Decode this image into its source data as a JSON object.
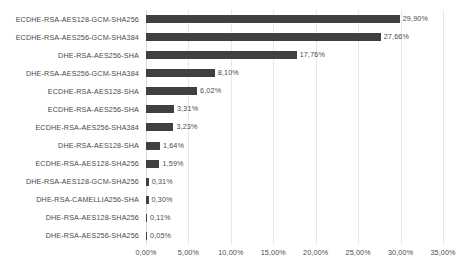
{
  "chart_data": {
    "type": "bar",
    "orientation": "horizontal",
    "title": "",
    "xlabel": "",
    "ylabel": "",
    "xlim": [
      0,
      35
    ],
    "grid": true,
    "legend": false,
    "value_suffix": "%",
    "decimal_separator": ",",
    "bar_color": "#404040",
    "gridline_color": "#e8e8e8",
    "background_color": "#ffffff",
    "xticks": [
      0,
      5,
      10,
      15,
      20,
      25,
      30,
      35
    ],
    "xtick_labels": [
      "0,00%",
      "5,00%",
      "10,00%",
      "15,00%",
      "20,00%",
      "25,00%",
      "30,00%",
      "35,00%"
    ],
    "categories": [
      "ECDHE-RSA-AES128-GCM-SHA256",
      "ECDHE-RSA-AES256-GCM-SHA384",
      "DHE-RSA-AES256-SHA",
      "DHE-RSA-AES256-GCM-SHA384",
      "ECDHE-RSA-AES128-SHA",
      "ECDHE-RSA-AES256-SHA",
      "ECDHE-RSA-AES256-SHA384",
      "DHE-RSA-AES128-SHA",
      "ECDHE-RSA-AES128-SHA256",
      "DHE-RSA-AES128-GCM-SHA256",
      "DHE-RSA-CAMELLIA256-SHA",
      "DHE-RSA-AES128-SHA256",
      "DHE-RSA-AES256-SHA256"
    ],
    "values": [
      29.9,
      27.66,
      17.76,
      8.1,
      6.02,
      3.31,
      3.23,
      1.64,
      1.59,
      0.31,
      0.3,
      0.11,
      0.05
    ],
    "value_labels": [
      "29,90%",
      "27,66%",
      "17,76%",
      "8,10%",
      "6,02%",
      "3,31%",
      "3,23%",
      "1,64%",
      "1,59%",
      "0,31%",
      "0,30%",
      "0,11%",
      "0,05%"
    ]
  }
}
